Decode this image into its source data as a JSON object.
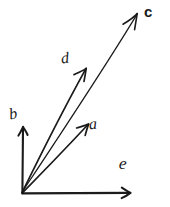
{
  "figure": {
    "background_color": "#ffffff",
    "ink_color": "#1a1a1a",
    "width": 170,
    "height": 207
  },
  "diagram_data": {
    "type": "vector-diagram",
    "origin": {
      "x": 22,
      "y": 193
    },
    "vectors": [
      {
        "label": "b",
        "from": {
          "x": 22,
          "y": 193
        },
        "to": {
          "x": 23,
          "y": 127
        },
        "angle_deg": 89,
        "length_px": 66,
        "stroke_width": 2.1,
        "label_position": {
          "x": 9,
          "y": 106
        },
        "arrowhead": true,
        "style": "axis"
      },
      {
        "label": "e",
        "from": {
          "x": 22,
          "y": 193
        },
        "to": {
          "x": 130,
          "y": 193
        },
        "angle_deg": 0,
        "length_px": 108,
        "stroke_width": 2.1,
        "label_position": {
          "x": 119,
          "y": 155
        },
        "arrowhead": true,
        "style": "axis"
      },
      {
        "label": "a",
        "from": {
          "x": 22,
          "y": 193
        },
        "to": {
          "x": 88,
          "y": 124
        },
        "angle_deg": 46,
        "length_px": 96,
        "stroke_width": 1.7,
        "label_position": {
          "x": 89,
          "y": 116
        },
        "arrowhead": true,
        "style": "vector"
      },
      {
        "label": "d",
        "from": {
          "x": 22,
          "y": 193
        },
        "to": {
          "x": 86,
          "y": 68
        },
        "angle_deg": 63,
        "length_px": 140,
        "stroke_width": 1.7,
        "label_position": {
          "x": 61,
          "y": 50
        },
        "arrowhead": true,
        "style": "vector"
      },
      {
        "label": "c",
        "from": {
          "x": 22,
          "y": 193
        },
        "to": {
          "x": 137,
          "y": 14
        },
        "angle_deg": 57,
        "length_px": 213,
        "stroke_width": 1.2,
        "label_position": {
          "x": 144,
          "y": 4
        },
        "arrowhead": true,
        "style": "vector-light"
      }
    ],
    "labels": [
      "b",
      "e",
      "a",
      "d",
      "c"
    ],
    "notes": "Five arrows radiate from a common origin at lower-left; b is the vertical axis, e the horizontal axis, and a, d, c are diagonal vectors of increasing length."
  }
}
